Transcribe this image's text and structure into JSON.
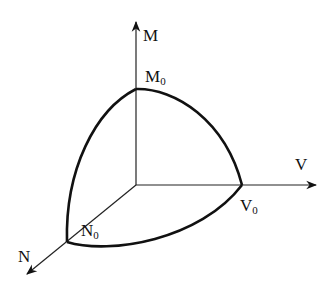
{
  "diagram": {
    "type": "3d-axes-surface-boundary",
    "axes": [
      {
        "id": "M",
        "label": "M",
        "intercept_label": "M",
        "intercept_sub": "0"
      },
      {
        "id": "V",
        "label": "V",
        "intercept_label": "V",
        "intercept_sub": "0"
      },
      {
        "id": "N",
        "label": "N",
        "intercept_label": "N",
        "intercept_sub": "0"
      }
    ],
    "colors": {
      "line": "#111111",
      "background": "#ffffff"
    }
  }
}
